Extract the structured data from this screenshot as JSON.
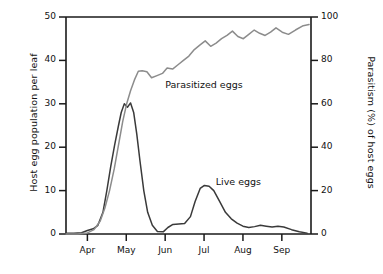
{
  "chart_data": {
    "type": "line",
    "title": "",
    "xlabel": "",
    "ylabel": "Host egg population per leaf",
    "y2label": "Parasitism (%) of host eggs",
    "grid": false,
    "legend_position": "inline-annotation",
    "xlim": [
      0,
      6.3
    ],
    "ylim": [
      0,
      50
    ],
    "y2lim": [
      0,
      100
    ],
    "x_tick_labels": [
      "Apr",
      "May",
      "Jun",
      "Jul",
      "Aug",
      "Sep"
    ],
    "x_tick_values": [
      0.55,
      1.55,
      2.55,
      3.55,
      4.55,
      5.55
    ],
    "y_tick_labels": [
      "0",
      "10",
      "20",
      "30",
      "40",
      "50"
    ],
    "y_tick_values": [
      0,
      10,
      20,
      30,
      40,
      50
    ],
    "y2_tick_labels": [
      "0",
      "20",
      "40",
      "60",
      "80",
      "100"
    ],
    "y2_tick_values": [
      0,
      20,
      40,
      60,
      80,
      100
    ],
    "series": [
      {
        "name": "Live eggs",
        "axis": "left",
        "color": "#3a3a3a",
        "label_x": 3.85,
        "label_y": 11.8,
        "x": [
          0.0,
          0.2,
          0.4,
          0.55,
          0.7,
          0.82,
          0.95,
          1.05,
          1.15,
          1.25,
          1.35,
          1.42,
          1.5,
          1.58,
          1.66,
          1.74,
          1.82,
          1.9,
          2.0,
          2.1,
          2.22,
          2.35,
          2.5,
          2.62,
          2.75,
          2.9,
          3.05,
          3.2,
          3.32,
          3.45,
          3.56,
          3.68,
          3.8,
          3.95,
          4.1,
          4.25,
          4.4,
          4.55,
          4.7,
          4.85,
          5.0,
          5.15,
          5.3,
          5.45,
          5.6,
          5.8,
          6.0,
          6.2
        ],
        "y": [
          0.2,
          0.2,
          0.3,
          0.8,
          1.2,
          2.0,
          5.0,
          10.0,
          15.5,
          20.5,
          25.0,
          28.0,
          30.0,
          29.2,
          30.2,
          28.0,
          23.0,
          17.0,
          10.0,
          5.0,
          2.0,
          0.6,
          0.5,
          1.5,
          2.2,
          2.3,
          2.4,
          4.0,
          7.5,
          10.5,
          11.2,
          11.0,
          10.0,
          7.5,
          5.0,
          3.5,
          2.5,
          1.8,
          1.5,
          1.7,
          2.0,
          1.8,
          1.6,
          1.8,
          1.6,
          1.0,
          0.5,
          0.2
        ]
      },
      {
        "name": "Parasitized eggs",
        "axis": "right",
        "color": "#8c8c8c",
        "label_x": 2.55,
        "label_y": 68.0,
        "x": [
          0.0,
          0.3,
          0.55,
          0.72,
          0.88,
          1.0,
          1.12,
          1.24,
          1.36,
          1.46,
          1.56,
          1.66,
          1.76,
          1.86,
          1.96,
          2.08,
          2.2,
          2.34,
          2.48,
          2.6,
          2.74,
          2.88,
          3.02,
          3.16,
          3.3,
          3.44,
          3.58,
          3.72,
          3.86,
          4.0,
          4.14,
          4.28,
          4.42,
          4.56,
          4.7,
          4.84,
          4.98,
          5.12,
          5.26,
          5.4,
          5.56,
          5.72,
          5.9,
          6.1,
          6.25
        ],
        "y": [
          0.0,
          0.0,
          0.5,
          2.0,
          6.0,
          12.0,
          20.0,
          30.0,
          42.0,
          52.0,
          60.0,
          66.0,
          71.0,
          75.0,
          75.2,
          74.8,
          72.0,
          73.0,
          74.0,
          76.5,
          76.0,
          78.0,
          80.0,
          82.0,
          85.0,
          87.0,
          89.0,
          86.5,
          88.0,
          90.0,
          91.5,
          93.5,
          91.0,
          90.0,
          92.0,
          94.0,
          92.5,
          91.5,
          93.0,
          95.0,
          93.0,
          92.0,
          94.0,
          96.0,
          96.5
        ]
      }
    ]
  }
}
